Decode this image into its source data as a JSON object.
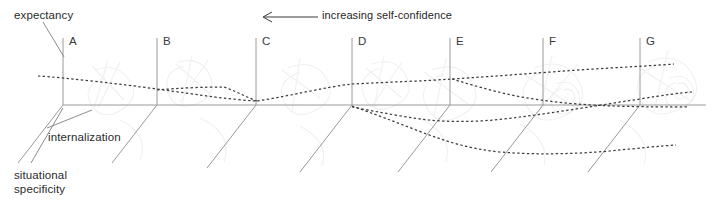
{
  "figure": {
    "background_color": "#ffffff",
    "line_color": "#8c8c8c",
    "dotted_color": "#3d3d3d",
    "text_color": "#2b2b2b",
    "watermark_color": "#f0eeec"
  },
  "annotations": {
    "expectancy": "expectancy",
    "internalization": "internalization",
    "situational_specificity": "situational\nspecificity",
    "arrow_label": "increasing self-confidence",
    "arrow_direction": "left"
  },
  "axis_groups": [
    {
      "letter": "A",
      "x": 63,
      "label_x": 69,
      "label_y": 34
    },
    {
      "letter": "B",
      "x": 157,
      "label_x": 163,
      "label_y": 34
    },
    {
      "letter": "C",
      "x": 256,
      "label_x": 262,
      "label_y": 34
    },
    {
      "letter": "D",
      "x": 352,
      "label_x": 358,
      "label_y": 34
    },
    {
      "letter": "E",
      "x": 450,
      "label_x": 456,
      "label_y": 34
    },
    {
      "letter": "F",
      "x": 543,
      "label_x": 549,
      "label_y": 34
    },
    {
      "letter": "G",
      "x": 640,
      "label_x": 646,
      "label_y": 34
    }
  ],
  "chart_data": {
    "type": "line",
    "title": "",
    "xlabel": "increasing self-confidence (right to left)",
    "ylabel": "expectancy",
    "zlabel": "situational specificity",
    "depth_label": "internalization",
    "categories": [
      "A",
      "B",
      "C",
      "D",
      "E",
      "F",
      "G"
    ],
    "category_x": [
      63,
      157,
      256,
      352,
      450,
      543,
      640
    ],
    "grid": false,
    "legend": false,
    "baseline_y": 105,
    "axis_top_y": 38,
    "series": [
      {
        "name": "upper-trajectory",
        "style": "dotted",
        "points": [
          [
            38,
            76
          ],
          [
            63,
            78
          ],
          [
            110,
            82
          ],
          [
            157,
            88
          ],
          [
            205,
            95
          ],
          [
            256,
            101
          ],
          [
            300,
            93
          ],
          [
            352,
            84
          ],
          [
            400,
            82
          ],
          [
            450,
            80
          ],
          [
            490,
            77
          ],
          [
            543,
            74
          ],
          [
            590,
            70
          ],
          [
            640,
            67
          ],
          [
            672,
            64
          ]
        ]
      },
      {
        "name": "mid-trajectory",
        "style": "dotted",
        "points": [
          [
            157,
            90
          ],
          [
            190,
            88
          ],
          [
            222,
            87
          ],
          [
            256,
            101
          ],
          [
            300,
            107
          ],
          [
            352,
            106
          ],
          [
            400,
            122
          ],
          [
            450,
            133
          ],
          [
            490,
            131
          ],
          [
            543,
            128
          ],
          [
            590,
            124
          ],
          [
            640,
            122
          ],
          [
            690,
            121
          ]
        ]
      },
      {
        "name": "lower-trajectory",
        "style": "dotted",
        "points": [
          [
            352,
            107
          ],
          [
            400,
            124
          ],
          [
            450,
            140
          ],
          [
            500,
            150
          ],
          [
            543,
            153
          ],
          [
            590,
            155
          ],
          [
            630,
            152
          ],
          [
            672,
            149
          ]
        ]
      },
      {
        "name": "descending-branch",
        "style": "dotted",
        "points": [
          [
            450,
            80
          ],
          [
            470,
            85
          ],
          [
            490,
            90
          ],
          [
            520,
            95
          ],
          [
            560,
            99
          ],
          [
            600,
            101
          ],
          [
            640,
            102
          ],
          [
            690,
            102
          ]
        ]
      },
      {
        "name": "low-rising-branch",
        "style": "dotted",
        "points": [
          [
            420,
            112
          ],
          [
            450,
            114
          ],
          [
            500,
            110
          ],
          [
            543,
            106
          ],
          [
            590,
            100
          ],
          [
            640,
            95
          ],
          [
            690,
            91
          ]
        ]
      }
    ]
  },
  "leaders": {
    "expectancy_leader": {
      "from": [
        42,
        22
      ],
      "to": [
        64,
        56
      ]
    },
    "internalization_leader": {
      "from": [
        46,
        128
      ],
      "to": [
        90,
        110
      ]
    },
    "situational_leader": {
      "from": [
        30,
        164
      ],
      "to": [
        62,
        110
      ]
    }
  },
  "arrow": {
    "tip_x": 262,
    "tail_x": 318,
    "y": 16
  }
}
